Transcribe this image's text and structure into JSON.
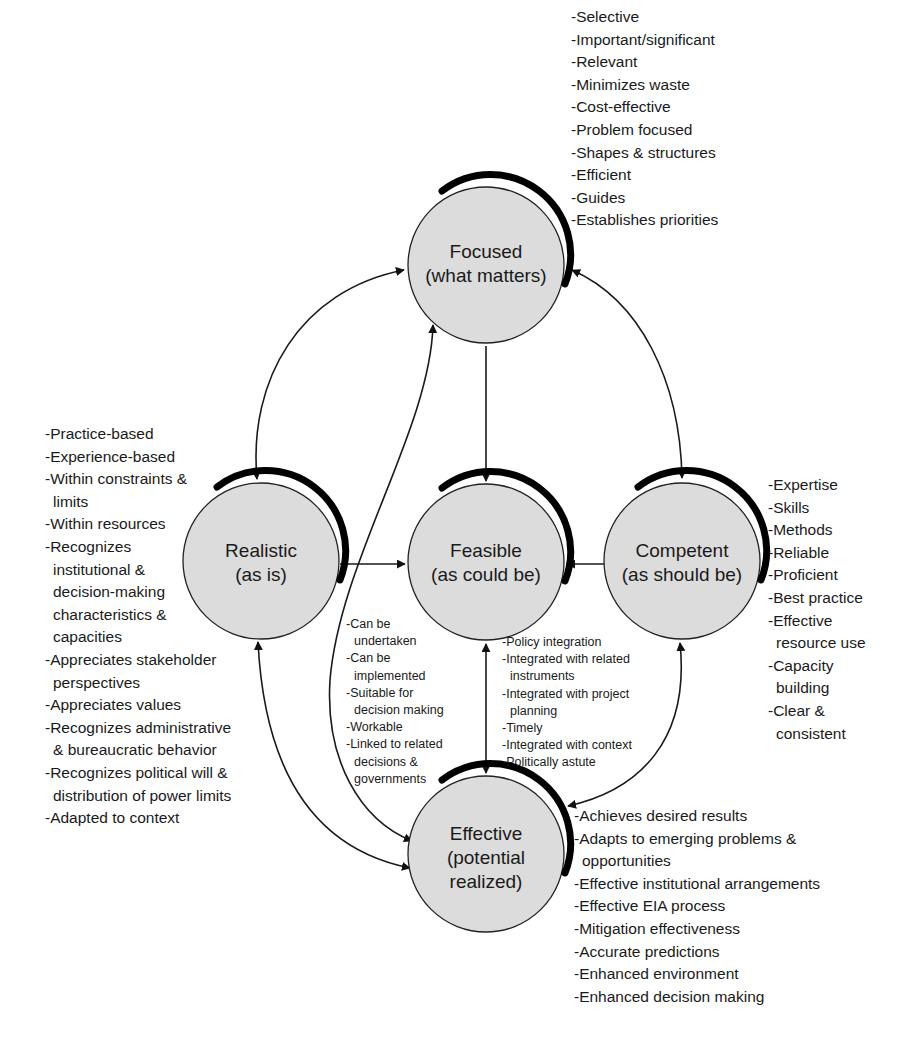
{
  "nodes": {
    "focused": {
      "title": "Focused",
      "subtitle": "(what matters)",
      "cx": 486,
      "cy": 265,
      "r": 78
    },
    "realistic": {
      "title": "Realistic",
      "subtitle": "(as is)",
      "cx": 261,
      "cy": 561,
      "r": 78
    },
    "feasible": {
      "title": "Feasible",
      "subtitle": "(as could be)",
      "cx": 486,
      "cy": 562,
      "r": 78
    },
    "competent": {
      "title": "Competent",
      "subtitle": "(as should be)",
      "cx": 682,
      "cy": 561,
      "r": 78
    },
    "effective": {
      "title": "Effective",
      "subtitle_1": "(potential",
      "subtitle_2": "realized)",
      "cx": 486,
      "cy": 854,
      "r": 78
    }
  },
  "edges": [
    {
      "from": "focused",
      "to": "realistic",
      "direction": "bidirectional"
    },
    {
      "from": "focused",
      "to": "competent",
      "direction": "bidirectional"
    },
    {
      "from": "focused",
      "to": "feasible",
      "direction": "forward"
    },
    {
      "from": "realistic",
      "to": "feasible",
      "direction": "forward"
    },
    {
      "from": "competent",
      "to": "feasible",
      "direction": "forward"
    },
    {
      "from": "feasible",
      "to": "effective",
      "direction": "bidirectional"
    },
    {
      "from": "realistic",
      "to": "effective",
      "direction": "bidirectional"
    },
    {
      "from": "competent",
      "to": "effective",
      "direction": "bidirectional"
    },
    {
      "from": "focused",
      "to": "effective",
      "direction": "bidirectional"
    }
  ],
  "lists": {
    "focused": [
      "-Selective",
      "-Important/significant",
      "-Relevant",
      "-Minimizes waste",
      "-Cost-effective",
      "-Problem focused",
      "-Shapes & structures",
      "-Efficient",
      "-Guides",
      "-Establishes priorities"
    ],
    "realistic": [
      "-Practice-based",
      "-Experience-based",
      "-Within constraints &",
      "limits",
      "-Within resources",
      "-Recognizes",
      "institutional &",
      "decision-making",
      "characteristics &",
      "capacities",
      "-Appreciates stakeholder",
      "perspectives",
      "-Appreciates values",
      "-Recognizes administrative",
      "& bureaucratic behavior",
      "-Recognizes political will &",
      "distribution of power limits",
      "-Adapted to context"
    ],
    "competent": [
      "-Expertise",
      "-Skills",
      "-Methods",
      "-Reliable",
      "-Proficient",
      "-Best practice",
      "-Effective",
      "resource use",
      "-Capacity",
      "building",
      "-Clear &",
      "consistent"
    ],
    "feasible_left": [
      "-Can be",
      "undertaken",
      "-Can be",
      "implemented",
      "-Suitable for",
      "decision making",
      "-Workable",
      "-Linked to related",
      "decisions &",
      "governments"
    ],
    "feasible_right": [
      "-Policy integration",
      "-Integrated with related",
      "instruments",
      "-Integrated with project",
      "planning",
      "-Timely",
      "-Integrated with context",
      "-Politically astute"
    ],
    "effective": [
      "-Achieves desired results",
      "-Adapts to emerging problems &",
      "opportunities",
      "-Effective institutional arrangements",
      "-Effective EIA process",
      "-Mitigation effectiveness",
      "-Accurate predictions",
      "-Enhanced environment",
      "-Enhanced decision making"
    ]
  }
}
